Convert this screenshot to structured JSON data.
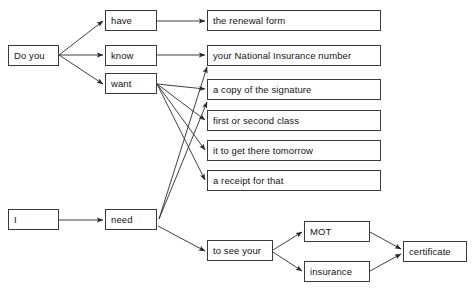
{
  "diagram": {
    "type": "sentence-tree-diagram",
    "background_color": "#ffffff",
    "border_color": "#3b3b3b",
    "text_color": "#141414",
    "line_color": "#2b2b2b",
    "nodes": [
      {
        "id": "do_you",
        "label": "Do you",
        "x": 8,
        "y": 45,
        "w": 51,
        "h": 21
      },
      {
        "id": "have",
        "label": "have",
        "x": 105,
        "y": 10,
        "w": 52,
        "h": 21
      },
      {
        "id": "know",
        "label": "know",
        "x": 105,
        "y": 45,
        "w": 52,
        "h": 21
      },
      {
        "id": "want",
        "label": "want",
        "x": 105,
        "y": 73,
        "w": 52,
        "h": 21
      },
      {
        "id": "renewal_form",
        "label": "the renewal form",
        "x": 207,
        "y": 10,
        "w": 174,
        "h": 21
      },
      {
        "id": "ni_number",
        "label": "your National Insurance number",
        "x": 207,
        "y": 45,
        "w": 174,
        "h": 21
      },
      {
        "id": "signature",
        "label": "a copy of the signature",
        "x": 207,
        "y": 79,
        "w": 174,
        "h": 21
      },
      {
        "id": "class",
        "label": "first or second class",
        "x": 207,
        "y": 110,
        "w": 174,
        "h": 21
      },
      {
        "id": "tomorrow",
        "label": "it to get there tomorrow",
        "x": 207,
        "y": 140,
        "w": 174,
        "h": 21
      },
      {
        "id": "receipt",
        "label": "a receipt for that",
        "x": 207,
        "y": 170,
        "w": 174,
        "h": 21
      },
      {
        "id": "i",
        "label": "I",
        "x": 8,
        "y": 209,
        "w": 51,
        "h": 21
      },
      {
        "id": "need",
        "label": "need",
        "x": 105,
        "y": 209,
        "w": 52,
        "h": 21
      },
      {
        "id": "to_see_your",
        "label": "to see your",
        "x": 207,
        "y": 240,
        "w": 66,
        "h": 21
      },
      {
        "id": "mot",
        "label": "MOT",
        "x": 304,
        "y": 221,
        "w": 66,
        "h": 21
      },
      {
        "id": "insurance",
        "label": "insurance",
        "x": 304,
        "y": 261,
        "w": 66,
        "h": 21
      },
      {
        "id": "certificate",
        "label": "certificate",
        "x": 403,
        "y": 241,
        "w": 64,
        "h": 21
      }
    ],
    "edges": [
      {
        "id": "e-doyou-have",
        "from": "do_you",
        "to": "have",
        "x1": 59,
        "y1": 55,
        "x2": 103,
        "y2": 21
      },
      {
        "id": "e-doyou-know",
        "from": "do_you",
        "to": "know",
        "x1": 59,
        "y1": 55,
        "x2": 103,
        "y2": 55
      },
      {
        "id": "e-doyou-want",
        "from": "do_you",
        "to": "want",
        "x1": 59,
        "y1": 55,
        "x2": 103,
        "y2": 84
      },
      {
        "id": "e-have-renewal",
        "from": "have",
        "to": "renewal_form",
        "x1": 157,
        "y1": 21,
        "x2": 205,
        "y2": 21
      },
      {
        "id": "e-know-ni",
        "from": "know",
        "to": "ni_number",
        "x1": 157,
        "y1": 55,
        "x2": 205,
        "y2": 55
      },
      {
        "id": "e-want-signature",
        "from": "want",
        "to": "signature",
        "x1": 157,
        "y1": 84,
        "x2": 205,
        "y2": 89
      },
      {
        "id": "e-want-class",
        "from": "want",
        "to": "class",
        "x1": 157,
        "y1": 84,
        "x2": 205,
        "y2": 120
      },
      {
        "id": "e-want-tomorrow",
        "from": "want",
        "to": "tomorrow",
        "x1": 157,
        "y1": 84,
        "x2": 205,
        "y2": 150
      },
      {
        "id": "e-want-receipt",
        "from": "want",
        "to": "receipt",
        "x1": 157,
        "y1": 84,
        "x2": 205,
        "y2": 180
      },
      {
        "id": "e-i-need",
        "from": "i",
        "to": "need",
        "x1": 59,
        "y1": 220,
        "x2": 103,
        "y2": 220
      },
      {
        "id": "e-need-ni",
        "from": "need",
        "to": "ni_number",
        "x1": 159,
        "y1": 219,
        "x2": 207,
        "y2": 67
      },
      {
        "id": "e-need-signature",
        "from": "need",
        "to": "signature",
        "x1": 159,
        "y1": 219,
        "x2": 207,
        "y2": 102
      },
      {
        "id": "e-need-toseeyour",
        "from": "need",
        "to": "to_see_your",
        "x1": 158,
        "y1": 226,
        "x2": 205,
        "y2": 251
      },
      {
        "id": "e-toseeyour-mot",
        "from": "to_see_your",
        "to": "mot",
        "x1": 273,
        "y1": 250,
        "x2": 302,
        "y2": 232
      },
      {
        "id": "e-toseeyour-insurance",
        "from": "to_see_your",
        "to": "insurance",
        "x1": 273,
        "y1": 252,
        "x2": 302,
        "y2": 271
      },
      {
        "id": "e-mot-certificate",
        "from": "mot",
        "to": "certificate",
        "x1": 370,
        "y1": 232,
        "x2": 401,
        "y2": 249
      },
      {
        "id": "e-insurance-certificate",
        "from": "insurance",
        "to": "certificate",
        "x1": 370,
        "y1": 271,
        "x2": 401,
        "y2": 254
      }
    ]
  }
}
